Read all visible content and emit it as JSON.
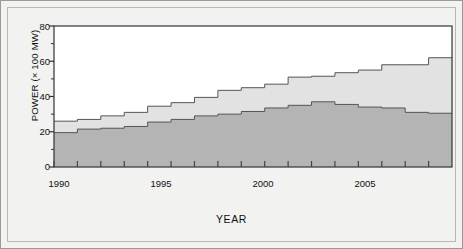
{
  "chart_data": {
    "type": "area",
    "title": "",
    "xlabel": "YEAR",
    "ylabel": "POWER (× 100 MW)",
    "xlim": [
      1990,
      2007
    ],
    "ylim": [
      0,
      80
    ],
    "grid": false,
    "legend_position": "inline-annotation",
    "step": "post",
    "stacked": true,
    "x_tick_labels": [
      "1990",
      "1995",
      "2000",
      "2005"
    ],
    "x_tick_values": [
      1990,
      1995,
      2000,
      2005
    ],
    "x_minor_ticks": [
      1990,
      1991,
      1992,
      1993,
      1994,
      1995,
      1996,
      1997,
      1998,
      1999,
      2000,
      2001,
      2002,
      2003,
      2004,
      2005,
      2006
    ],
    "y_tick_labels": [
      "0",
      "20",
      "40",
      "60",
      "80"
    ],
    "y_tick_values": [
      0,
      20,
      40,
      60,
      80
    ],
    "y_minor_tick_values": [
      10,
      30,
      50,
      70
    ],
    "categories": [
      1990,
      1991,
      1992,
      1993,
      1994,
      1995,
      1996,
      1997,
      1998,
      1999,
      2000,
      2001,
      2002,
      2003,
      2004,
      2005,
      2006
    ],
    "series": [
      {
        "name": "Thermal Power",
        "color": "#b4b4b4",
        "values": [
          19.5,
          21.5,
          22,
          23,
          25.5,
          27,
          29,
          30,
          31.5,
          33.5,
          35,
          37,
          35.5,
          34,
          33.5,
          31,
          30.5
        ]
      },
      {
        "name": "Hydro Power",
        "color": "#e2e2e2",
        "values": [
          6.5,
          5.5,
          7,
          8,
          9,
          9.5,
          10.5,
          13.5,
          13.5,
          13.5,
          16,
          14.5,
          18,
          21,
          24.5,
          27,
          31.5
        ]
      }
    ],
    "totals": [
      26,
      27,
      29,
      31,
      34.5,
      36.5,
      39.5,
      43.5,
      45,
      47,
      51,
      51.5,
      53.5,
      55,
      58,
      58,
      62
    ],
    "annotations": [
      {
        "text_line1": "Hydro",
        "text_line2": "Power",
        "x": 2003.2,
        "y": 56
      },
      {
        "text_line1": "Thermal",
        "text_line2": "Power",
        "x": 2000.3,
        "y": 22
      }
    ],
    "colors": {
      "thermal": "#b4b4b4",
      "hydro": "#e2e2e2",
      "line": "#555555",
      "axis": "#333333",
      "plot_background": "#ffffff",
      "page_background": "#f2f2f0",
      "frame": "#9a9a9a"
    }
  }
}
